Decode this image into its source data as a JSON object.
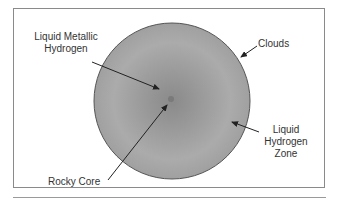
{
  "diagram": {
    "labels": {
      "metallic_line1": "Liquid Metallic",
      "metallic_line2": "Hydrogen",
      "clouds": "Clouds",
      "rocky_core": "Rocky Core",
      "zone_line1": "Liquid",
      "zone_line2": "Hydrogen",
      "zone_line3": "Zone"
    },
    "colors": {
      "outer_gray": "#8c8c8c",
      "mid_gray": "#a6a6a6",
      "inner_gray": "#9a9a9a",
      "outline": "#555555",
      "arrow": "#222222",
      "text": "#333333"
    }
  }
}
